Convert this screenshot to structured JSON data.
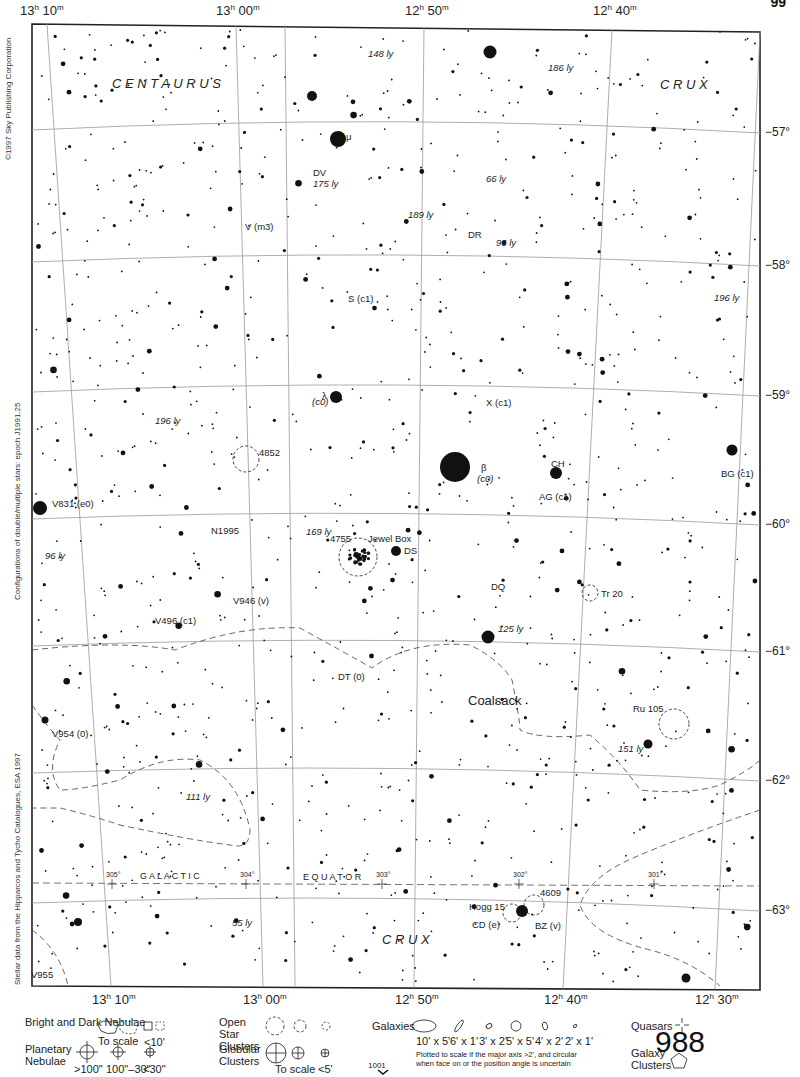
{
  "page": {
    "number": "988",
    "corner_mark": "99",
    "next_page_ref": "1001",
    "copyright": "©1997 Sky Publishing Corporation",
    "side_note_middle": "Configurations of double/multiple stars: epoch J1991.25",
    "side_note_bottom": "Stellar data from the Hipparcos and Tycho Catalogues, ESA 1997"
  },
  "axes": {
    "ra_top": [
      {
        "h": "13",
        "m": "10",
        "x": 20
      },
      {
        "h": "13",
        "m": "00",
        "x": 216
      },
      {
        "h": "12",
        "m": "50",
        "x": 405
      },
      {
        "h": "12",
        "m": "40",
        "x": 593
      }
    ],
    "ra_bottom": [
      {
        "h": "13",
        "m": "10",
        "x": 92
      },
      {
        "h": "13",
        "m": "00",
        "x": 243
      },
      {
        "h": "12",
        "m": "50",
        "x": 395
      },
      {
        "h": "12",
        "m": "40",
        "x": 544
      },
      {
        "h": "12",
        "m": "30",
        "x": 695
      }
    ],
    "dec": [
      {
        "label": "−57°",
        "y": 133
      },
      {
        "label": "−58°",
        "y": 266
      },
      {
        "label": "−59°",
        "y": 396
      },
      {
        "label": "−60°",
        "y": 525
      },
      {
        "label": "−61°",
        "y": 652
      },
      {
        "label": "−62°",
        "y": 781
      },
      {
        "label": "−63°",
        "y": 911
      }
    ]
  },
  "constellations": [
    {
      "name": "C E N T A U R U S",
      "x": 112,
      "y": 88,
      "size": 13
    },
    {
      "name": "C R U X",
      "x": 660,
      "y": 89,
      "size": 13
    },
    {
      "name": "C R U X",
      "x": 382,
      "y": 944,
      "size": 13
    }
  ],
  "galactic_equator": {
    "label_left": "G A L A C T I C",
    "label_right": "E Q U A T O R",
    "longitudes": [
      {
        "label": "305°",
        "x": 112
      },
      {
        "label": "304°",
        "x": 246
      },
      {
        "label": "303°",
        "x": 382
      },
      {
        "label": "302°",
        "x": 519
      },
      {
        "label": "301°",
        "x": 654
      }
    ]
  },
  "objects": [
    {
      "label": "μ",
      "x": 346,
      "y": 140,
      "italic": false
    },
    {
      "label": "DV",
      "x": 313,
      "y": 176,
      "italic": false
    },
    {
      "label": "175 ly",
      "x": 313,
      "y": 187,
      "italic": true
    },
    {
      "label": "148 ly",
      "x": 368,
      "y": 57,
      "italic": true
    },
    {
      "label": "186 ly",
      "x": 548,
      "y": 71,
      "italic": true
    },
    {
      "label": "66 ly",
      "x": 486,
      "y": 182,
      "italic": true
    },
    {
      "label": "189 ly",
      "x": 408,
      "y": 218,
      "italic": true
    },
    {
      "label": "V (m3)",
      "x": 245,
      "y": 230,
      "italic": false
    },
    {
      "label": "DR",
      "x": 468,
      "y": 238,
      "italic": false
    },
    {
      "label": "96 ly",
      "x": 496,
      "y": 246,
      "italic": true
    },
    {
      "label": "S (c1)",
      "x": 348,
      "y": 302,
      "italic": false
    },
    {
      "label": "196 ly",
      "x": 714,
      "y": 301,
      "italic": true
    },
    {
      "label": "λ",
      "x": 322,
      "y": 399,
      "italic": false
    },
    {
      "label": "(c0)",
      "x": 312,
      "y": 405,
      "italic": true
    },
    {
      "label": "X (c1)",
      "x": 486,
      "y": 406,
      "italic": false
    },
    {
      "label": "196 ly",
      "x": 155,
      "y": 424,
      "italic": true
    },
    {
      "label": "4852",
      "x": 259,
      "y": 456,
      "italic": false
    },
    {
      "label": "β",
      "x": 481,
      "y": 471,
      "italic": false
    },
    {
      "label": "(c0)",
      "x": 477,
      "y": 482,
      "italic": true
    },
    {
      "label": "CH",
      "x": 551,
      "y": 467,
      "italic": false
    },
    {
      "label": "AG (c1)",
      "x": 539,
      "y": 500,
      "italic": false
    },
    {
      "label": "BG (c1)",
      "x": 721,
      "y": 477,
      "italic": false
    },
    {
      "label": "V831 (e0)",
      "x": 52,
      "y": 507,
      "italic": false
    },
    {
      "label": "N1995",
      "x": 211,
      "y": 534,
      "italic": false
    },
    {
      "label": "169 ly",
      "x": 306,
      "y": 535,
      "italic": true
    },
    {
      "label": "4755",
      "x": 330,
      "y": 542,
      "italic": false
    },
    {
      "label": "Jewel Box",
      "x": 368,
      "y": 542,
      "italic": false
    },
    {
      "label": "DS",
      "x": 404,
      "y": 554,
      "italic": false
    },
    {
      "label": "96 ly",
      "x": 45,
      "y": 559,
      "italic": true
    },
    {
      "label": "DQ",
      "x": 491,
      "y": 590,
      "italic": false
    },
    {
      "label": "Tr 20",
      "x": 601,
      "y": 597,
      "italic": false
    },
    {
      "label": "V946 (v)",
      "x": 233,
      "y": 604,
      "italic": false
    },
    {
      "label": "V496 (c1)",
      "x": 155,
      "y": 624,
      "italic": false
    },
    {
      "label": "125 ly",
      "x": 498,
      "y": 632,
      "italic": true
    },
    {
      "label": "DT (0)",
      "x": 338,
      "y": 680,
      "italic": false
    },
    {
      "label": "Coalsack",
      "x": 468,
      "y": 705,
      "italic": false,
      "size": 13
    },
    {
      "label": "Ru 105",
      "x": 633,
      "y": 712,
      "italic": false
    },
    {
      "label": "V954 (0)",
      "x": 52,
      "y": 737,
      "italic": false
    },
    {
      "label": "151 ly",
      "x": 618,
      "y": 752,
      "italic": true
    },
    {
      "label": "111 ly",
      "x": 186,
      "y": 800,
      "italic": true
    },
    {
      "label": "55 ly",
      "x": 232,
      "y": 926,
      "italic": true
    },
    {
      "label": "4609",
      "x": 540,
      "y": 896,
      "italic": false
    },
    {
      "label": "Hogg 15",
      "x": 469,
      "y": 910,
      "italic": false
    },
    {
      "label": "CD (e)",
      "x": 472,
      "y": 928,
      "italic": false
    },
    {
      "label": "BZ (v)",
      "x": 535,
      "y": 929,
      "italic": false
    },
    {
      "label": "V955",
      "x": 31,
      "y": 978,
      "italic": false
    }
  ],
  "legend": {
    "nebulae": {
      "title": "Bright and Dark Nebulae",
      "to_scale": "To scale",
      "small": "<10'"
    },
    "planetary": {
      "title": "Planetary Nebulae",
      "sizes": [
        ">100\"",
        "100\"–30\"",
        "<30\""
      ]
    },
    "open_clusters": {
      "title": "Open Star Clusters"
    },
    "globular": {
      "title": "Globular Clusters",
      "to_scale": "To scale",
      "small": "<5'"
    },
    "galaxies": {
      "title": "Galaxies",
      "sizes": [
        "10' x 5'",
        "6' x 1'",
        "3' x 2'",
        "5' x 5'",
        "4' x 2'",
        "2' x 1'"
      ],
      "note_line1": "Plotted to scale if the major axis >2', and circular",
      "note_line2": "when face on or the position angle is uncertain"
    },
    "quasars": {
      "title": "Quasars"
    },
    "galaxy_clusters": {
      "title": "Galaxy Clusters"
    }
  },
  "colors": {
    "ink": "#111111",
    "grid": "#888888",
    "paper": "#ffffff"
  }
}
